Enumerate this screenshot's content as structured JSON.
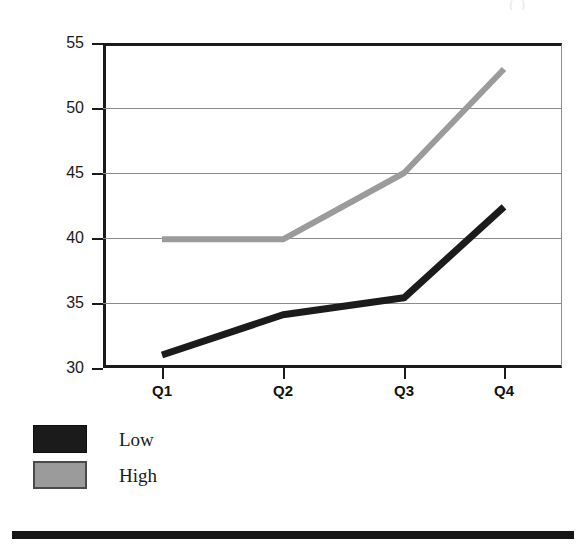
{
  "top_caption": "( )",
  "chart_data": {
    "type": "line",
    "title": "",
    "subtitle": "",
    "xlabel": "",
    "ylabel": "",
    "categories": [
      "Q1",
      "Q2",
      "Q3",
      "Q4"
    ],
    "series": [
      {
        "name": "Low",
        "color": "#1b1b1b",
        "values": [
          31.0,
          34.1,
          35.4,
          42.4
        ]
      },
      {
        "name": "High",
        "color": "#9b9b9b",
        "values": [
          39.9,
          39.9,
          45.0,
          53.0
        ]
      }
    ],
    "ylim": [
      30,
      55
    ],
    "yticks": [
      30,
      35,
      40,
      45,
      50,
      55
    ],
    "ytick_labels": [
      "30",
      "35",
      "40",
      "45",
      "50",
      "55"
    ],
    "xtick_labels": [
      "Q1",
      "Q2",
      "Q3",
      "Q4"
    ],
    "grid": true,
    "grid_axis": "y",
    "legend_position": "bottom-left",
    "legend_entries": [
      "Low",
      "High"
    ]
  },
  "legend": {
    "items": [
      {
        "label": "Low",
        "swatch": "black-swatch"
      },
      {
        "label": "High",
        "swatch": "gray-swatch"
      }
    ]
  },
  "colors": {
    "low_series": "#1b1b1b",
    "high_series": "#9b9b9b",
    "axis": "#1a1a1a",
    "gridline": "#8a8a8a",
    "background": "#ffffff",
    "rule": "#161616"
  }
}
